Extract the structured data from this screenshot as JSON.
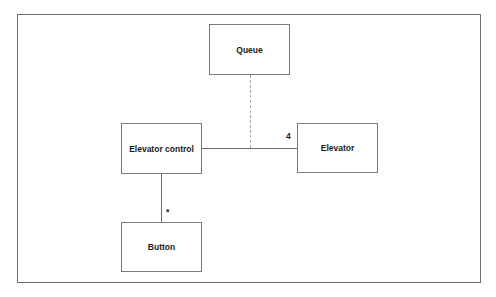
{
  "diagram": {
    "type": "uml-class-association",
    "classes": [
      {
        "id": "queue",
        "label": "Queue"
      },
      {
        "id": "elevator_control",
        "label": "Elevator control"
      },
      {
        "id": "elevator",
        "label": "Elevator"
      },
      {
        "id": "button",
        "label": "Button"
      }
    ],
    "associations": [
      {
        "from": "elevator_control",
        "to": "elevator",
        "style": "solid",
        "multiplicity_to": "4"
      },
      {
        "from": "queue",
        "to": "elevator_control-elevator association",
        "style": "dashed"
      },
      {
        "from": "elevator_control",
        "to": "button",
        "style": "solid",
        "multiplicity_to": "*"
      }
    ],
    "multiplicities": {
      "elevator": "4",
      "button": "*"
    }
  }
}
